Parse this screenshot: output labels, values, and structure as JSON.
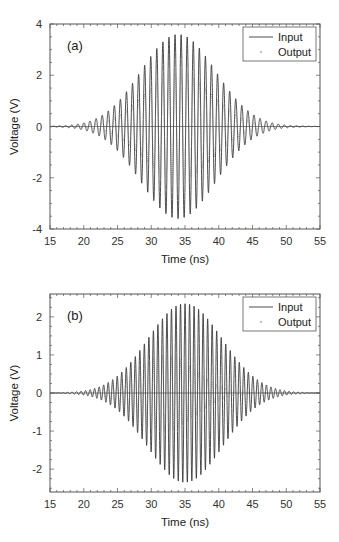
{
  "chart_data": [
    {
      "type": "line",
      "panel_label": "(a)",
      "xlabel": "Time (ns)",
      "ylabel": "Voltage (V)",
      "xlim": [
        15,
        55
      ],
      "ylim": [
        -4,
        4
      ],
      "xticks": [
        15,
        20,
        25,
        30,
        35,
        40,
        45,
        50,
        55
      ],
      "yticks": [
        -4,
        -2,
        0,
        2,
        4
      ],
      "grid": false,
      "legend_position": "upper right",
      "legend": [
        "Input",
        "Output"
      ],
      "series": [
        {
          "name": "Input",
          "style": "solid",
          "envelope_peak": 3.6,
          "envelope_center_ns": 34,
          "envelope_sigma_ns": 5.5,
          "carrier_period_ns": 0.9
        },
        {
          "name": "Output",
          "style": "dotted",
          "envelope_peak": 2.1,
          "envelope_center_ns": 34,
          "envelope_sigma_ns": 5.0,
          "carrier_period_ns": 0.9
        }
      ]
    },
    {
      "type": "line",
      "panel_label": "(b)",
      "xlabel": "Time (ns)",
      "ylabel": "Voltage (V)",
      "xlim": [
        15,
        55
      ],
      "ylim": [
        -2.6,
        2.6
      ],
      "xticks": [
        15,
        20,
        25,
        30,
        35,
        40,
        45,
        50,
        55
      ],
      "yticks": [
        -2,
        -1,
        0,
        1,
        2
      ],
      "grid": false,
      "legend_position": "upper right",
      "legend": [
        "Input",
        "Output"
      ],
      "series": [
        {
          "name": "Input",
          "style": "solid",
          "envelope_peak": 2.35,
          "envelope_center_ns": 35,
          "envelope_sigma_ns": 5.5,
          "carrier_period_ns": 0.67
        },
        {
          "name": "Output",
          "style": "dotted",
          "envelope_peak": 1.0,
          "envelope_center_ns": 32,
          "envelope_sigma_ns": 4.5,
          "carrier_period_ns": 0.67
        }
      ]
    }
  ],
  "panels": [
    {
      "label": "(a)",
      "legend_input": "Input",
      "legend_output": "Output",
      "xlabel": "Time (ns)",
      "ylabel": "Voltage (V)"
    },
    {
      "label": "(b)",
      "legend_input": "Input",
      "legend_output": "Output",
      "xlabel": "Time (ns)",
      "ylabel": "Voltage (V)"
    }
  ],
  "colors": {
    "axis": "#555555",
    "input": "#3a3a3a",
    "output": "#777777"
  }
}
